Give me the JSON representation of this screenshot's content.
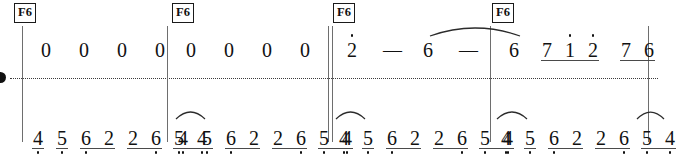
{
  "score": {
    "notation_system": "jianpu",
    "width": 658,
    "height": 152,
    "ink_color": "#111111",
    "line_color": "#6e6e6e",
    "divider_color": "#3b3b3b"
  },
  "chords": [
    {
      "label": "F6",
      "x": 14,
      "y": 3
    },
    {
      "label": "F6",
      "x": 172,
      "y": 3
    },
    {
      "label": "F6",
      "x": 333,
      "y": 3
    },
    {
      "label": "F6",
      "x": 492,
      "y": 3
    }
  ],
  "barlines": [
    {
      "name": "barline-1",
      "x": 22,
      "type": "single"
    },
    {
      "name": "barline-2",
      "x": 167,
      "type": "single"
    },
    {
      "name": "barline-3",
      "x": 328,
      "type": "double"
    },
    {
      "name": "barline-4",
      "x": 490,
      "type": "single"
    },
    {
      "name": "barline-5",
      "x": 648,
      "type": "single"
    }
  ],
  "divider": {
    "x": 10,
    "y": 78,
    "width": 648
  },
  "left_marker": {
    "x": -5,
    "y": 72
  },
  "measures": [
    {
      "index": 1,
      "upper": [
        {
          "num": "0",
          "x": 24,
          "octave": 0
        },
        {
          "num": "0",
          "x": 62,
          "octave": 0
        },
        {
          "num": "0",
          "x": 100,
          "octave": 0
        },
        {
          "num": "0",
          "x": 138,
          "octave": 0
        }
      ],
      "lower": [
        {
          "num": "4",
          "x": 16,
          "octave": -1
        },
        {
          "num": "5",
          "x": 40,
          "octave": -1
        },
        {
          "num": "6",
          "x": 64,
          "octave": -1
        },
        {
          "num": "2",
          "x": 87,
          "octave": 0
        },
        {
          "num": "2",
          "x": 111,
          "octave": 0
        },
        {
          "num": "6",
          "x": 134,
          "octave": -1
        },
        {
          "num": "5",
          "x": 157,
          "octave": -1
        },
        {
          "num": "4",
          "x": 180,
          "octave": -1
        }
      ]
    },
    {
      "index": 2,
      "upper": [
        {
          "num": "0",
          "x": 24,
          "octave": 0
        },
        {
          "num": "0",
          "x": 62,
          "octave": 0
        },
        {
          "num": "0",
          "x": 100,
          "octave": 0
        },
        {
          "num": "0",
          "x": 138,
          "octave": 0
        }
      ],
      "lower": [
        {
          "num": "4",
          "x": 16,
          "octave": -1
        },
        {
          "num": "5",
          "x": 40,
          "octave": -1
        },
        {
          "num": "6",
          "x": 64,
          "octave": -1
        },
        {
          "num": "2",
          "x": 87,
          "octave": 0
        },
        {
          "num": "2",
          "x": 111,
          "octave": 0
        },
        {
          "num": "6",
          "x": 134,
          "octave": -1
        },
        {
          "num": "5",
          "x": 157,
          "octave": -1
        },
        {
          "num": "4",
          "x": 180,
          "octave": -1
        }
      ]
    },
    {
      "index": 3,
      "upper": [
        {
          "num": "2",
          "x": 24,
          "octave": 1
        },
        {
          "num": "—",
          "x": 62,
          "octave": 0,
          "is_dash": true
        },
        {
          "num": "6",
          "x": 100,
          "octave": 0
        },
        {
          "num": "—",
          "x": 138,
          "octave": 0,
          "is_dash": true
        }
      ],
      "lower": [
        {
          "num": "4",
          "x": 16,
          "octave": -1
        },
        {
          "num": "5",
          "x": 40,
          "octave": -1
        },
        {
          "num": "6",
          "x": 64,
          "octave": -1
        },
        {
          "num": "2",
          "x": 87,
          "octave": 0
        },
        {
          "num": "2",
          "x": 111,
          "octave": 0
        },
        {
          "num": "6",
          "x": 134,
          "octave": -1
        },
        {
          "num": "5",
          "x": 157,
          "octave": -1
        },
        {
          "num": "4",
          "x": 180,
          "octave": -1
        }
      ]
    },
    {
      "index": 4,
      "upper": [
        {
          "num": "6",
          "x": 24,
          "octave": 0
        },
        {
          "num": "7",
          "x": 57,
          "octave": 0
        },
        {
          "num": "1",
          "x": 80,
          "octave": 1
        },
        {
          "num": "2",
          "x": 103,
          "octave": 1
        },
        {
          "num": "7",
          "x": 136,
          "octave": 0
        },
        {
          "num": "6",
          "x": 159,
          "octave": 0
        }
      ],
      "lower": [
        {
          "num": "4",
          "x": 16,
          "octave": -1
        },
        {
          "num": "5",
          "x": 40,
          "octave": -1
        },
        {
          "num": "6",
          "x": 64,
          "octave": -1
        },
        {
          "num": "2",
          "x": 87,
          "octave": 0
        },
        {
          "num": "2",
          "x": 111,
          "octave": 0
        },
        {
          "num": "6",
          "x": 134,
          "octave": -1
        },
        {
          "num": "5",
          "x": 157,
          "octave": -1
        },
        {
          "num": "4",
          "x": 180,
          "octave": -1
        }
      ]
    }
  ],
  "beams": {
    "lower_pattern": [
      {
        "from": 0,
        "to": 0
      },
      {
        "from": 1,
        "to": 1
      },
      {
        "from": 2,
        "to": 3
      },
      {
        "from": 4,
        "to": 5
      },
      {
        "from": 6,
        "to": 7
      }
    ],
    "upper_measure4": [
      {
        "from": 1,
        "to": 3
      },
      {
        "from": 4,
        "to": 5
      }
    ]
  },
  "slurs": [
    {
      "name": "slur-lower-m1-m2",
      "x1": 176,
      "x2": 205,
      "y": 119,
      "lift": 11
    },
    {
      "name": "slur-lower-m2-m3",
      "x1": 336,
      "x2": 365,
      "y": 119,
      "lift": 11
    },
    {
      "name": "slur-lower-m3-m4",
      "x1": 497,
      "x2": 527,
      "y": 119,
      "lift": 11
    },
    {
      "name": "slur-lower-m4-end",
      "x1": 637,
      "x2": 664,
      "y": 119,
      "lift": 11
    },
    {
      "name": "tie-upper-m3",
      "x1": 430,
      "x2": 520,
      "y": 36,
      "lift": 13
    }
  ]
}
